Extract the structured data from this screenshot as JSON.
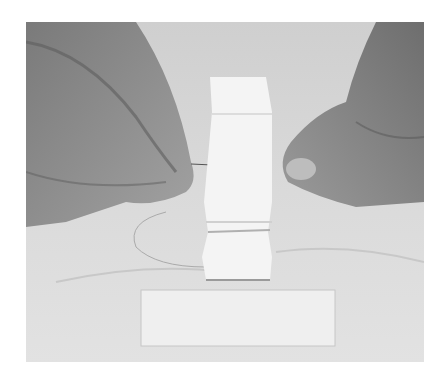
{
  "image": {
    "description": "Grayscale photo of two hands sewing a folded white ribbon with a needle and thread on a marble surface; a flat white ribbon strip lies below",
    "colors": {
      "background": "#ffffff",
      "surface": "#d9d9d9",
      "ribbon": "#f4f4f4",
      "skin": "#8c8c8c",
      "skin_dark": "#5e5e5e"
    }
  }
}
